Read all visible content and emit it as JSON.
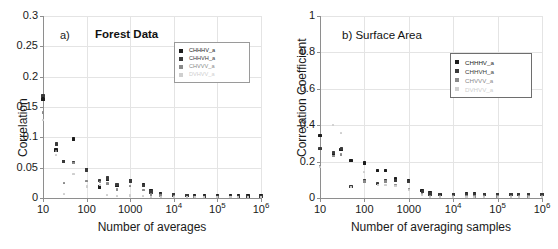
{
  "figure": {
    "series_styles": [
      {
        "key": "CHHHV_a",
        "color": "#1c1c1c",
        "size": 3.4
      },
      {
        "key": "CHHVH_a",
        "color": "#3a3a3a",
        "size": 3.2
      },
      {
        "key": "CHVVV_a",
        "color": "#8a8a8a",
        "size": 2.4
      },
      {
        "key": "DVHVV_a",
        "color": "#cfcfcf",
        "size": 2.2
      }
    ]
  },
  "panel_a": {
    "tag": "a)",
    "title": "Forest Data",
    "legend": [
      "CHHHV_a",
      "CHHVH_a",
      "CHVVV_a",
      "DVHVV_a"
    ],
    "chart_data": {
      "type": "scatter",
      "title": "Forest Data",
      "xlabel": "Number of averages",
      "ylabel": "Correlation",
      "xscale": "log",
      "xlim": [
        10,
        1000000
      ],
      "ylim": [
        0,
        0.3
      ],
      "yticks": [
        0,
        0.05,
        0.1,
        0.15,
        0.2,
        0.25,
        0.3
      ],
      "ytick_labels": [
        "0",
        "0.05",
        "0.1",
        "0.15",
        "0.2",
        "0.25",
        "0.3"
      ],
      "xticks": [
        10,
        100,
        1000,
        10000,
        100000,
        1000000
      ],
      "xtick_labels": [
        "10",
        "100",
        "1000",
        "10⁴",
        "10⁵",
        "10⁶"
      ],
      "grid": true,
      "legend_position": "upper-right",
      "series": [
        {
          "name": "CHHHV_a",
          "x": [
            10,
            20,
            30,
            50,
            100,
            200,
            300,
            500,
            1000,
            2000,
            3000,
            5000,
            10000,
            20000,
            30000,
            50000,
            100000,
            200000,
            300000,
            500000,
            1000000
          ],
          "y": [
            0.163,
            0.079,
            0.06,
            0.097,
            0.047,
            0.018,
            0.03,
            0.021,
            0.029,
            0.022,
            0.012,
            0.007,
            0.006,
            0.004,
            0.004,
            0.003,
            0.003,
            0.003,
            0.003,
            0.003,
            0.003
          ]
        },
        {
          "name": "CHHVH_a",
          "x": [
            10,
            20,
            30,
            50,
            100,
            200,
            300,
            500,
            1000,
            2000,
            3000,
            5000,
            10000,
            20000,
            30000,
            50000,
            100000,
            200000,
            300000,
            500000,
            1000000
          ],
          "y": [
            0.169,
            0.089,
            0.06,
            0.058,
            0.046,
            0.029,
            0.033,
            0.022,
            0.028,
            0.021,
            0.01,
            0.006,
            0.005,
            0.004,
            0.003,
            0.003,
            0.003,
            0.003,
            0.002,
            0.003,
            0.003
          ]
        },
        {
          "name": "CHVVV_a",
          "x": [
            10,
            20,
            30,
            50,
            100,
            200,
            300,
            500,
            1000,
            2000,
            3000,
            5000,
            10000,
            20000,
            30000,
            50000,
            100000,
            200000,
            300000,
            500000,
            1000000
          ],
          "y": [
            0.141,
            0.077,
            0.025,
            0.058,
            0.028,
            0.026,
            0.024,
            0.014,
            0.02,
            0.013,
            0.006,
            0.004,
            0.003,
            0.002,
            0.002,
            0.002,
            0.002,
            0.002,
            0.002,
            0.002,
            0.002
          ]
        },
        {
          "name": "DVHVV_a",
          "x": [
            10,
            20,
            30,
            50,
            100,
            200,
            300,
            500,
            1000,
            2000,
            3000,
            5000,
            10000,
            20000,
            30000,
            50000,
            100000,
            200000,
            300000,
            500000,
            1000000
          ],
          "y": [
            0.129,
            0.071,
            0.007,
            0.04,
            0.019,
            0.021,
            0.005,
            0.003,
            0.004,
            0.003,
            0.002,
            0.002,
            0.002,
            0.002,
            0.002,
            0.002,
            0.002,
            0.002,
            0.002,
            0.002,
            0.002
          ]
        }
      ]
    }
  },
  "panel_b": {
    "tag": "b)",
    "title": "Surface Area",
    "legend": [
      "CHHHV_a",
      "CHHVH_a",
      "CHVVV_a",
      "DVHVV_a"
    ],
    "chart_data": {
      "type": "scatter",
      "title": "b) Surface Area",
      "xlabel": "Number of averaging samples",
      "ylabel": "Correlation Coefficient",
      "xscale": "log",
      "xlim": [
        10,
        1000000
      ],
      "ylim": [
        0,
        1
      ],
      "yticks": [
        0,
        0.2,
        0.4,
        0.6,
        0.8,
        1
      ],
      "ytick_labels": [
        "0",
        "0.2",
        "0.4",
        "0.6",
        "0.8",
        "1"
      ],
      "xticks": [
        10,
        100,
        1000,
        10000,
        100000,
        1000000
      ],
      "xtick_labels": [
        "10",
        "100",
        "1000",
        "10⁴",
        "10⁵",
        "10⁶"
      ],
      "grid": true,
      "legend_position": "upper-right",
      "series": [
        {
          "name": "CHHHV_a",
          "x": [
            10,
            20,
            30,
            50,
            100,
            200,
            300,
            500,
            1000,
            2000,
            3000,
            5000,
            10000,
            20000,
            30000,
            50000,
            100000,
            200000,
            300000,
            500000,
            1000000
          ],
          "y": [
            0.345,
            0.245,
            0.265,
            0.205,
            0.192,
            0.15,
            0.15,
            0.105,
            0.095,
            0.04,
            0.03,
            0.02,
            0.02,
            0.022,
            0.022,
            0.02,
            0.02,
            0.02,
            0.02,
            0.02,
            0.02
          ]
        },
        {
          "name": "CHHVH_a",
          "x": [
            10,
            20,
            30,
            50,
            100,
            200,
            300,
            500,
            1000,
            2000,
            3000,
            5000,
            10000,
            20000,
            30000,
            50000,
            100000,
            200000,
            300000,
            500000,
            1000000
          ],
          "y": [
            0.27,
            0.25,
            0.272,
            0.062,
            0.093,
            0.078,
            0.095,
            0.095,
            0.09,
            0.035,
            0.022,
            0.018,
            0.018,
            0.018,
            0.018,
            0.018,
            0.018,
            0.018,
            0.018,
            0.018,
            0.018
          ]
        },
        {
          "name": "CHVVV_a",
          "x": [
            10,
            20,
            30,
            50,
            100,
            200,
            300,
            500,
            1000,
            2000,
            3000,
            5000,
            10000,
            20000,
            30000,
            50000,
            100000,
            200000,
            300000,
            500000,
            1000000
          ],
          "y": [
            0.175,
            0.232,
            0.24,
            0.062,
            0.09,
            0.072,
            0.09,
            0.072,
            0.048,
            0.022,
            0.01,
            0.008,
            0.008,
            0.008,
            0.008,
            0.008,
            0.008,
            0.008,
            0.008,
            0.008,
            0.008
          ]
        },
        {
          "name": "DVHVV_a",
          "x": [
            10,
            20,
            30,
            50,
            100,
            200,
            300,
            500,
            1000,
            2000,
            3000,
            5000,
            10000,
            20000,
            30000,
            50000,
            100000,
            200000,
            300000,
            500000,
            1000000
          ],
          "y": [
            0.172,
            0.4,
            0.355,
            0.062,
            0.142,
            0.07,
            0.07,
            0.068,
            0.045,
            0.018,
            0.006,
            0.006,
            0.006,
            0.006,
            0.006,
            0.006,
            0.006,
            0.006,
            0.006,
            0.006,
            0.006
          ]
        }
      ]
    }
  }
}
